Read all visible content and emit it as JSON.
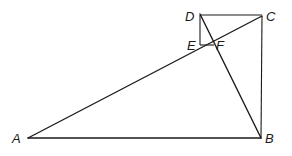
{
  "diagram": {
    "points": {
      "A": {
        "label": "A",
        "x": 28,
        "y": 138
      },
      "B": {
        "label": "B",
        "x": 261,
        "y": 138
      },
      "C": {
        "label": "C",
        "x": 262,
        "y": 16
      },
      "D": {
        "label": "D",
        "x": 200,
        "y": 15
      },
      "E": {
        "label": "E",
        "x": 200,
        "y": 45
      },
      "F": {
        "label": "F",
        "x": 213,
        "y": 44
      }
    },
    "segments": [
      "AB",
      "AC",
      "DB",
      "DC",
      "CB",
      "DE",
      "EF"
    ]
  }
}
